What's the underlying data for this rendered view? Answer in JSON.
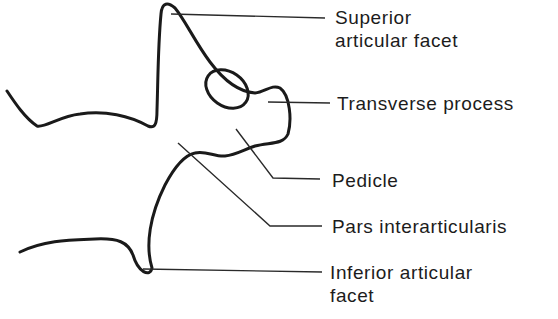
{
  "diagram": {
    "type": "anatomical line drawing",
    "colors": {
      "line": "#1a1a1a",
      "text": "#1c1c1c",
      "background": "#ffffff"
    },
    "labels": [
      {
        "id": "superior-articular-facet",
        "line1": "Superior",
        "line2": "articular facet"
      },
      {
        "id": "transverse-process",
        "line1": "Transverse process"
      },
      {
        "id": "pedicle",
        "line1": "Pedicle"
      },
      {
        "id": "pars-interarticularis",
        "line1": "Pars interarticularis"
      },
      {
        "id": "inferior-articular-facet",
        "line1": "Inferior articular",
        "line2": "facet"
      }
    ]
  }
}
